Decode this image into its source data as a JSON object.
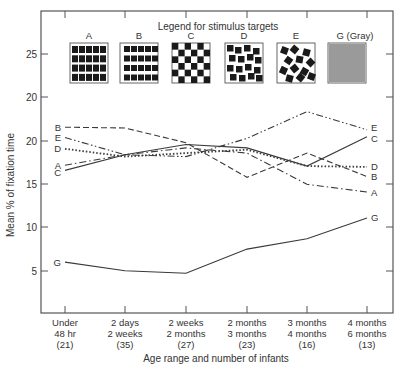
{
  "chart_data": {
    "type": "line",
    "title": "Legend for stimulus targets",
    "xlabel": "Age range and number of infants",
    "ylabel": "Mean % of fixation time",
    "categories": [
      [
        "Under",
        "48 hr",
        "(21)"
      ],
      [
        "2 days",
        "2 weeks",
        "(35)"
      ],
      [
        "2 weeks",
        "2 months",
        "(27)"
      ],
      [
        "2 months",
        "3 months",
        "(23)"
      ],
      [
        "3 months",
        "4 months",
        "(16)"
      ],
      [
        "4 months",
        "6 months",
        "(13)"
      ]
    ],
    "y_tick_labels": [
      {
        "label": "25",
        "y": 54
      },
      {
        "label": "20",
        "y": 97
      },
      {
        "label": "20",
        "y": 141
      },
      {
        "label": "15",
        "y": 184
      },
      {
        "label": "10",
        "y": 227
      },
      {
        "label": "5",
        "y": 271
      }
    ],
    "ylim": [
      3,
      27
    ],
    "grid": false,
    "series": [
      {
        "name": "A",
        "style": "dash-dot",
        "values": [
          17.2,
          18.4,
          19.2,
          18.6,
          15.0,
          14.1
        ]
      },
      {
        "name": "B",
        "style": "dashed",
        "values": [
          21.6,
          21.5,
          19.8,
          15.8,
          18.6,
          15.9
        ]
      },
      {
        "name": "C",
        "style": "solid-ticked",
        "values": [
          16.6,
          18.4,
          19.6,
          19.2,
          17.1,
          20.5
        ]
      },
      {
        "name": "D",
        "style": "dotted",
        "values": [
          19.1,
          18.2,
          18.6,
          19.0,
          17.1,
          17.0
        ]
      },
      {
        "name": "E",
        "style": "dash-dot-dot",
        "values": [
          20.4,
          18.4,
          18.2,
          20.3,
          23.4,
          21.3
        ]
      },
      {
        "name": "G",
        "style": "solid",
        "values": [
          6.0,
          5.0,
          4.7,
          7.5,
          8.7,
          11.1
        ]
      }
    ],
    "legend": {
      "title": "Legend for stimulus targets",
      "position": "top",
      "entries": [
        {
          "label": "A",
          "pattern": "grid of squares"
        },
        {
          "label": "B",
          "pattern": "grid of wide rectangles"
        },
        {
          "label": "C",
          "pattern": "checkerboard"
        },
        {
          "label": "D",
          "pattern": "irregular squares"
        },
        {
          "label": "E",
          "pattern": "randomly rotated squares"
        },
        {
          "label": "G (Gray)",
          "pattern": "uniform gray"
        }
      ]
    }
  },
  "colors": {
    "line": "#3a3a3a",
    "gray_swatch": "#9a9a9a",
    "swatch_dark": "#1a1a1a"
  }
}
